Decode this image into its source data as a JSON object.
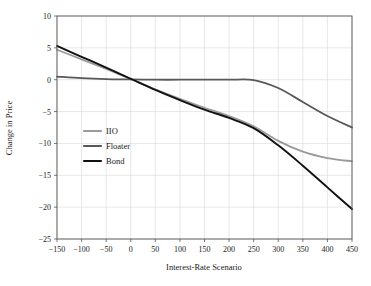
{
  "chart_data": {
    "type": "line",
    "title": "",
    "xlabel": "Interest-Rate Scenario",
    "ylabel": "Change in Price",
    "xlim": [
      -150,
      450
    ],
    "ylim": [
      -25,
      10
    ],
    "grid": true,
    "legend_position": "inner-left",
    "xticks": [
      -150,
      -100,
      -50,
      0,
      50,
      100,
      150,
      200,
      250,
      300,
      350,
      400,
      450
    ],
    "xtick_labels": [
      "−150",
      "−100",
      "−50",
      "0",
      "50",
      "100",
      "150",
      "200",
      "250",
      "300",
      "350",
      "400",
      "450"
    ],
    "yticks": [
      10,
      5,
      0,
      -5,
      -10,
      -15,
      -20,
      -25
    ],
    "ytick_labels": [
      "10",
      "5",
      "0",
      "−5",
      "−10",
      "−15",
      "−20",
      "−25"
    ],
    "x": [
      -150,
      -100,
      -50,
      0,
      50,
      100,
      150,
      200,
      250,
      300,
      350,
      400,
      450
    ],
    "series": [
      {
        "name": "IIO",
        "color": "#9a9a9a",
        "width": 1.8,
        "values": [
          4.7,
          3.2,
          1.7,
          0.1,
          -1.5,
          -3.0,
          -4.4,
          -5.7,
          -7.3,
          -9.6,
          -11.3,
          -12.3,
          -12.8
        ]
      },
      {
        "name": "Floater",
        "color": "#585858",
        "width": 1.8,
        "values": [
          0.5,
          0.25,
          0.1,
          0.05,
          0.0,
          0.0,
          0.0,
          0.0,
          -0.05,
          -1.3,
          -3.5,
          -5.7,
          -7.5
        ]
      },
      {
        "name": "Bond",
        "color": "#111111",
        "width": 1.9,
        "values": [
          5.3,
          3.6,
          1.9,
          0.15,
          -1.6,
          -3.2,
          -4.7,
          -6.0,
          -7.6,
          -10.3,
          -13.5,
          -16.9,
          -20.3
        ]
      }
    ]
  },
  "legend": {
    "entries": [
      {
        "label": "IIO"
      },
      {
        "label": "Floater"
      },
      {
        "label": "Bond"
      }
    ]
  },
  "caption": {
    "text": ""
  }
}
